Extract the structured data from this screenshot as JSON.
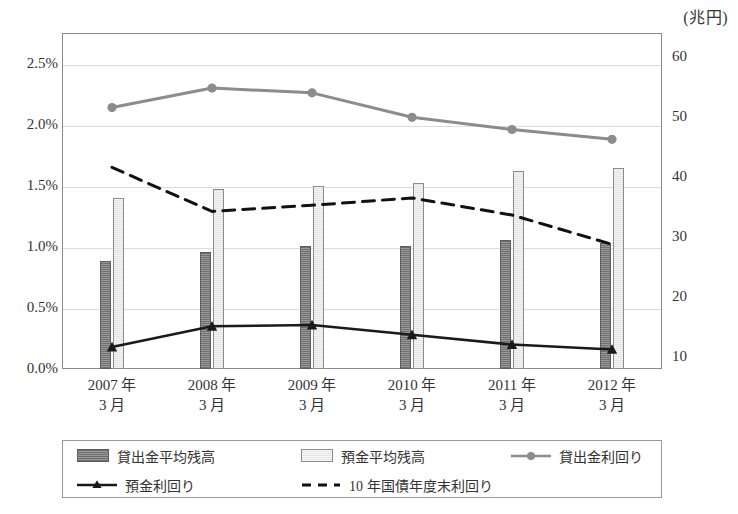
{
  "unit_caption": "(兆円)",
  "axes": {
    "left_ticks": [
      "2.5%",
      "2.0%",
      "1.5%",
      "1.0%",
      "0.5%",
      "0.0%"
    ],
    "left_values": [
      2.5,
      2.0,
      1.5,
      1.0,
      0.5,
      0.0
    ],
    "right_ticks": [
      "60",
      "50",
      "40",
      "30",
      "20",
      "10"
    ],
    "right_values": [
      60,
      50,
      40,
      30,
      20,
      10
    ],
    "categories": [
      {
        "year": "2007 年",
        "month": "3 月"
      },
      {
        "year": "2008 年",
        "month": "3 月"
      },
      {
        "year": "2009 年",
        "month": "3 月"
      },
      {
        "year": "2010 年",
        "month": "3 月"
      },
      {
        "year": "2011 年",
        "month": "3 月"
      },
      {
        "year": "2012 年",
        "month": "3 月"
      }
    ]
  },
  "legend": {
    "items": [
      {
        "label": "貸出金平均残高",
        "marker": "bar-dark-hatched"
      },
      {
        "label": "預金平均残高",
        "marker": "bar-light-hatched"
      },
      {
        "label": "貸出金利回り",
        "marker": "gray-line-circle"
      },
      {
        "label": "預金利回り",
        "marker": "black-line-triangle"
      },
      {
        "label": "10 年国債年度末利回り",
        "marker": "black-dashed-line"
      }
    ]
  },
  "colors": {
    "loan_bar": "#7a7a7a",
    "deposit_bar": "#ececec",
    "loan_yield_line": "#8c8c8c",
    "deposit_yield_line": "#1a1a1a",
    "jgb_line": "#111111",
    "grid": "#dcdcdc",
    "frame": "#8a8a8a"
  },
  "chart_data": {
    "type": "bar",
    "title": "",
    "subtitle": "",
    "xlabel": "",
    "ylabel": "",
    "y2label": "兆円",
    "grid": true,
    "legend_position": "bottom",
    "categories": [
      "2007年3月",
      "2008年3月",
      "2009年3月",
      "2010年3月",
      "2011年3月",
      "2012年3月"
    ],
    "left_axis": {
      "label": "",
      "ticks": [
        0.0,
        0.5,
        1.0,
        1.5,
        2.0,
        2.5
      ],
      "ylim": [
        0.0,
        2.75
      ],
      "unit": "%"
    },
    "right_axis": {
      "label": "兆円",
      "ticks": [
        10,
        20,
        30,
        40,
        50,
        60
      ],
      "ylim": [
        8,
        64
      ],
      "unit": "兆円"
    },
    "series": [
      {
        "name": "貸出金平均残高",
        "type": "bar",
        "axis": "right",
        "unit": "兆円",
        "values": [
          26.0,
          27.5,
          28.5,
          28.5,
          29.5,
          29.0
        ]
      },
      {
        "name": "預金平均残高",
        "type": "bar",
        "axis": "right",
        "unit": "兆円",
        "values": [
          36.5,
          38.0,
          38.5,
          39.0,
          41.0,
          41.5
        ]
      },
      {
        "name": "貸出金利回り",
        "type": "line",
        "axis": "left",
        "unit": "%",
        "marker": "circle",
        "values": [
          2.14,
          2.3,
          2.26,
          2.06,
          1.96,
          1.88
        ]
      },
      {
        "name": "預金利回り",
        "type": "line",
        "axis": "left",
        "unit": "%",
        "marker": "triangle",
        "values": [
          0.18,
          0.35,
          0.36,
          0.28,
          0.2,
          0.16
        ]
      },
      {
        "name": "10 年国債年度末利回り",
        "type": "line",
        "axis": "left",
        "unit": "%",
        "style": "dashed",
        "values": [
          1.65,
          1.29,
          1.34,
          1.4,
          1.26,
          1.02
        ]
      }
    ]
  }
}
